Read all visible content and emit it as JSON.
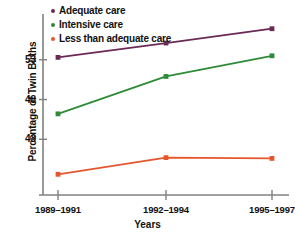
{
  "chart_data": {
    "type": "line",
    "title": "",
    "subtitle": "",
    "xlabel": "Years",
    "ylabel": "Percentage of Twin Births",
    "categories": [
      "1989–1991",
      "1992–1994",
      "1995–1997"
    ],
    "series": [
      {
        "name": "Adequate care",
        "color": "#6b2a55",
        "values": [
          53.3,
          55.1,
          56.9
        ]
      },
      {
        "name": "Intensive care",
        "color": "#2e8b37",
        "values": [
          46.2,
          50.9,
          53.5
        ]
      },
      {
        "name": "Less than adequate care",
        "color": "#e4572e",
        "values": [
          38.6,
          40.7,
          40.6
        ]
      }
    ],
    "y_ticks": [
      53,
      48,
      43
    ],
    "ylim": [
      36.0,
      58.5
    ],
    "grid": false,
    "legend_position": "top-left",
    "axis_color": "#808080",
    "text_color": "#111111",
    "background": "#ffffff"
  },
  "legend": {
    "items": [
      {
        "label": "Adequate care",
        "color": "#6b2a55",
        "marker": "dot-marker"
      },
      {
        "label": "Intensive care",
        "color": "#2e8b37",
        "marker": "dot-marker"
      },
      {
        "label": "Less than adequate care",
        "color": "#e4572e",
        "marker": "dot-marker"
      }
    ]
  },
  "axes": {
    "y_title": "Percentage of Twin Births",
    "x_title": "Years",
    "y_tick_labels": [
      "53",
      "48",
      "43"
    ],
    "x_tick_labels": [
      "1989–1991",
      "1992–1994",
      "1995–1997"
    ]
  }
}
